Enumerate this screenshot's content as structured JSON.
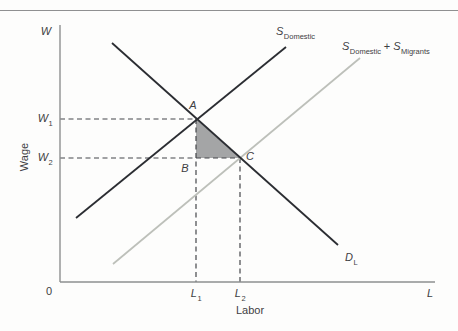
{
  "figure": {
    "y_axis_symbol": "W",
    "x_axis_symbol": "L",
    "origin": "0",
    "y_axis_title": "Wage",
    "x_axis_title": "Labor"
  },
  "points": {
    "a": "A",
    "b": "B",
    "c": "C"
  },
  "levels": {
    "w1": {
      "main": "W",
      "sub": "1"
    },
    "w2": {
      "main": "W",
      "sub": "2"
    },
    "l1": {
      "main": "L",
      "sub": "1"
    },
    "l2": {
      "main": "L",
      "sub": "2"
    }
  },
  "curves": {
    "supply_domestic": {
      "main": "S",
      "sub": "Domestic"
    },
    "supply_combined": {
      "main1": "S",
      "sub1": "Domestic",
      "plus": " + ",
      "main2": "S",
      "sub2": "Migrants"
    },
    "demand": {
      "main": "D",
      "sub": "L"
    }
  },
  "colors": {
    "dark_line": "#2b2d32",
    "light_line": "#bdc0ba",
    "axis": "#8d8f90",
    "dashed": "#45474a",
    "triangle_fill": "#a4a5a6",
    "divider": "#8f9091",
    "text": "#3e4043"
  }
}
